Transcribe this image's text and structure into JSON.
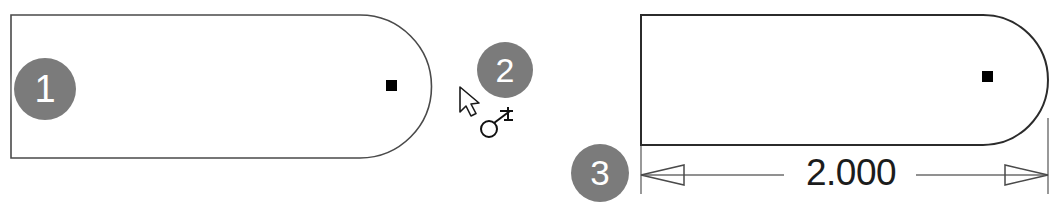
{
  "scene": {
    "title": "Slot sketch with smart dimension",
    "background_color": "#ffffff",
    "line_color": "#3a3a3a",
    "callout_color": "#7b7b7b",
    "callout_text_color": "#ffffff",
    "point_color": "#000000"
  },
  "callouts": [
    {
      "id": "callout-1",
      "label": "1"
    },
    {
      "id": "callout-2",
      "label": "2"
    },
    {
      "id": "callout-3",
      "label": "3"
    }
  ],
  "left_view": {
    "name": "slot-profile-unconstrained",
    "sketch_point_label": "center-point",
    "shape": "straight-slot with rounded right end"
  },
  "right_view": {
    "name": "slot-profile-dimensioned",
    "sketch_point_label": "center-point",
    "shape": "straight-slot with rounded right end"
  },
  "dimension": {
    "name": "overall-length",
    "value": "2.000",
    "arrow_style": "open-outward",
    "units": ""
  },
  "cursor": {
    "pointer_icon": "arrow-cursor-icon",
    "tool_icon": "smart-dimension-icon"
  }
}
